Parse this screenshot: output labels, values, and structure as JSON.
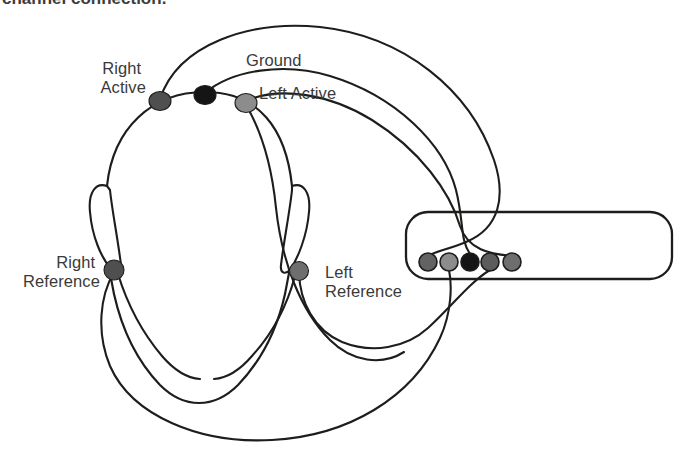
{
  "figure": {
    "caption_partial": "channel connection.",
    "background_color": "#ffffff",
    "line_color": "#1d1d1b",
    "label_color": "#3a3a38"
  },
  "labels": {
    "right_active": {
      "line1": "Right",
      "line2": "Active"
    },
    "ground": "Ground",
    "left_active": "Left Active",
    "right_reference": {
      "line1": "Right",
      "line2": "Reference"
    },
    "left_reference": {
      "line1": "Left",
      "line2": "Reference"
    }
  },
  "electrodes": [
    {
      "id": "right-active",
      "label": "Right Active",
      "color": "#4f4f4f",
      "cx": 160,
      "cy": 101,
      "rx": 11,
      "ry": 9.5
    },
    {
      "id": "ground",
      "label": "Ground",
      "color": "#151515",
      "cx": 205,
      "cy": 95,
      "rx": 11,
      "ry": 9.5
    },
    {
      "id": "left-active",
      "label": "Left Active",
      "color": "#8c8c8c",
      "cx": 246,
      "cy": 103,
      "rx": 11,
      "ry": 9.5
    },
    {
      "id": "right-reference",
      "label": "Right Reference",
      "color": "#4f4f4f",
      "cx": 114,
      "cy": 270,
      "rx": 10,
      "ry": 10
    },
    {
      "id": "left-reference",
      "label": "Left Reference",
      "color": "#6e6e6e",
      "cx": 299,
      "cy": 271,
      "rx": 9.5,
      "ry": 9.5
    }
  ],
  "device": {
    "name": "amplifier-unit",
    "x": 406,
    "y": 212,
    "width": 266,
    "height": 67,
    "corner_radius": 22,
    "ports": [
      {
        "index": 1,
        "id": "port-1",
        "connected_to": "Right Active",
        "color": "#636363",
        "cx": 428,
        "cy": 262,
        "r": 9
      },
      {
        "index": 2,
        "id": "port-2",
        "connected_to": "Right Reference",
        "color": "#8c8c8c",
        "cx": 449,
        "cy": 262,
        "r": 9
      },
      {
        "index": 3,
        "id": "port-3",
        "connected_to": "Ground",
        "color": "#151515",
        "cx": 470,
        "cy": 262,
        "r": 9
      },
      {
        "index": 4,
        "id": "port-4",
        "connected_to": "Left Reference",
        "color": "#5c5c5c",
        "cx": 490,
        "cy": 262,
        "r": 9
      },
      {
        "index": 5,
        "id": "port-5",
        "connected_to": "Left Active",
        "color": "#6e6e6e",
        "cx": 512,
        "cy": 262,
        "r": 9
      }
    ]
  },
  "wires": [
    {
      "id": "wire-right-active",
      "from": "Right Active",
      "to": "port-1"
    },
    {
      "id": "wire-ground",
      "from": "Ground",
      "to": "port-3"
    },
    {
      "id": "wire-left-active",
      "from": "Left Active",
      "to": "port-5"
    },
    {
      "id": "wire-right-reference",
      "from": "Right Reference",
      "to": "port-2"
    },
    {
      "id": "wire-left-reference",
      "from": "Left Reference",
      "to": "port-4"
    }
  ]
}
